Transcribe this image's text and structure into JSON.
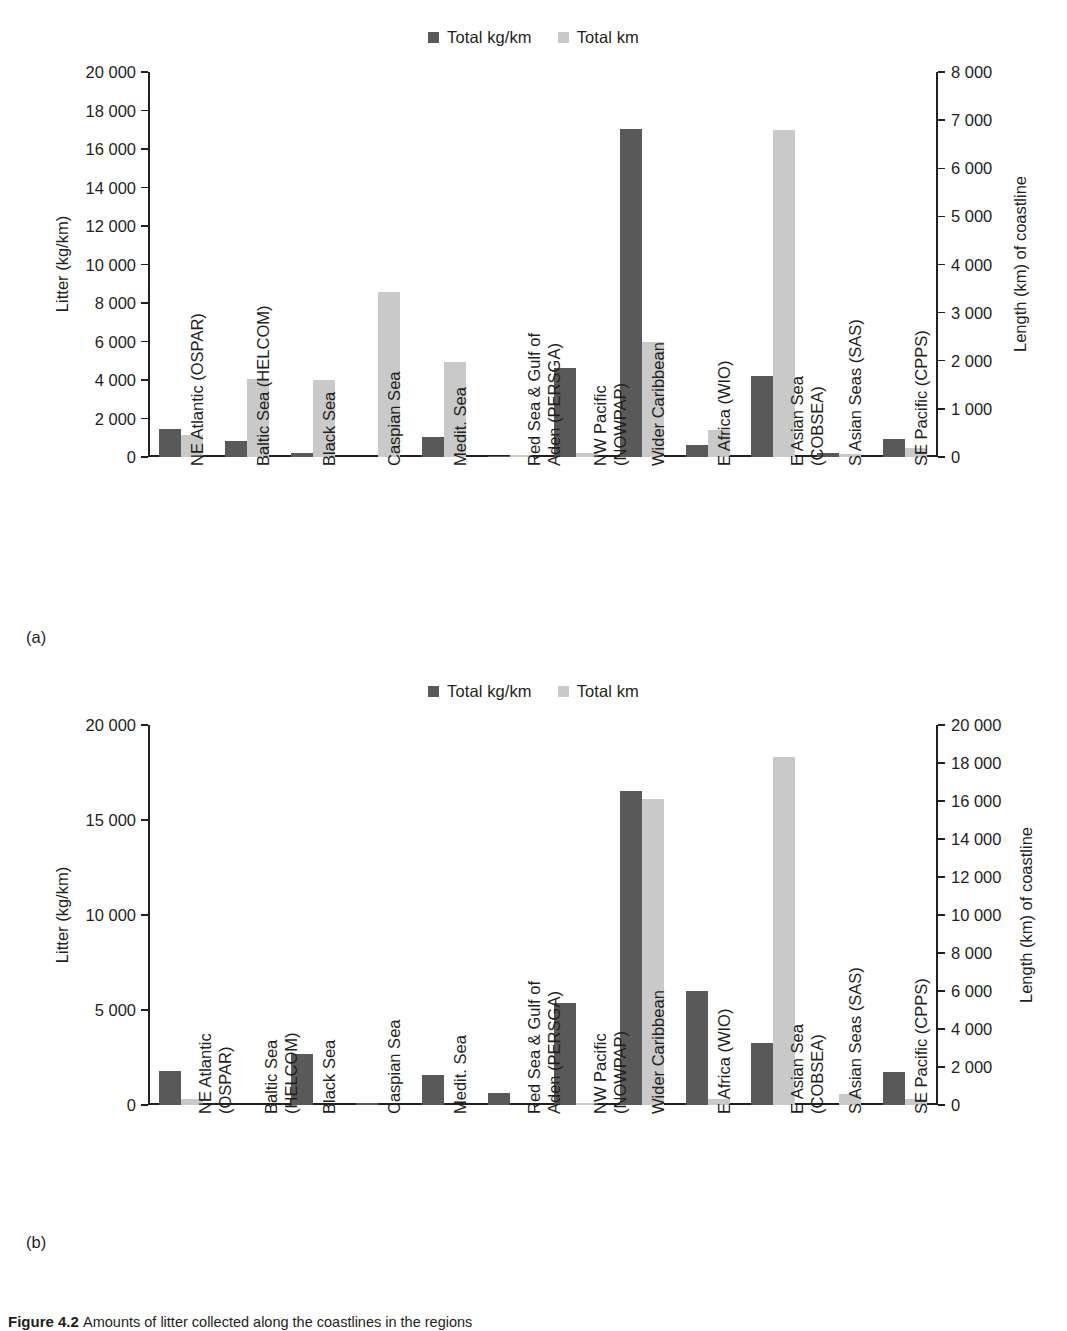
{
  "figure": {
    "caption_label": "Figure 4.2",
    "caption_text": "Amounts of litter collected along the coastlines in the regions"
  },
  "legend": {
    "series": [
      {
        "label": "Total kg/km",
        "color": "#595959",
        "swatch": "square-swatch"
      },
      {
        "label": "Total km",
        "color": "#c9c9c9",
        "swatch": "square-swatch"
      }
    ]
  },
  "panels": [
    {
      "tag": "(a)"
    },
    {
      "tag": "(b)"
    }
  ],
  "categories": [
    {
      "line1": "NE Atlantic (OSPAR)",
      "line2": "",
      "b_line1": "NE Atlantic",
      "b_line2": "(OSPAR)"
    },
    {
      "line1": "Baltic Sea (HELCOM)",
      "line2": "",
      "b_line1": "Baltic Sea",
      "b_line2": "(HELCOM)"
    },
    {
      "line1": "Black Sea",
      "line2": "",
      "b_line1": "Black Sea",
      "b_line2": ""
    },
    {
      "line1": "Caspian Sea",
      "line2": "",
      "b_line1": "Caspian Sea",
      "b_line2": ""
    },
    {
      "line1": "Medit. Sea",
      "line2": "",
      "b_line1": "Medit. Sea",
      "b_line2": ""
    },
    {
      "line1": "Red Sea & Gulf of",
      "line2": "Aden (PERSGA)",
      "b_line1": "Red Sea & Gulf of",
      "b_line2": "Aden (PERSGA)"
    },
    {
      "line1": "NW Pacific",
      "line2": "(NOWPAP)",
      "b_line1": "NW Pacific",
      "b_line2": "(NOWPAP)"
    },
    {
      "line1": "Wider Caribbean",
      "line2": "",
      "b_line1": "Wider Caribbean",
      "b_line2": ""
    },
    {
      "line1": "E Africa (WIO)",
      "line2": "",
      "b_line1": "E Africa (WIO)",
      "b_line2": ""
    },
    {
      "line1": "E Asian Sea",
      "line2": "(COBSEA)",
      "b_line1": "E Asian Sea",
      "b_line2": "(COBSEA)"
    },
    {
      "line1": "S Asian Seas (SAS)",
      "line2": "",
      "b_line1": "S Asian Seas (SAS)",
      "b_line2": ""
    },
    {
      "line1": "SE Pacific (CPPS)",
      "line2": "",
      "b_line1": "SE Pacific (CPPS)",
      "b_line2": ""
    }
  ],
  "chart_data": [
    {
      "type": "bar",
      "panel": "(a)",
      "title": "",
      "xlabel": "",
      "ylabel": "Litter (kg/km)",
      "y2label": "Length (km) of coastline",
      "ylim": [
        0,
        20000
      ],
      "y2lim": [
        0,
        8000
      ],
      "yticks": [
        0,
        2000,
        4000,
        6000,
        8000,
        10000,
        12000,
        14000,
        16000,
        18000,
        20000
      ],
      "yticklabels": [
        "0",
        "2 000",
        "4 000",
        "6 000",
        "8 000",
        "10 000",
        "12 000",
        "14 000",
        "16 000",
        "18 000",
        "20 000"
      ],
      "y2ticks": [
        0,
        1000,
        2000,
        3000,
        4000,
        5000,
        6000,
        7000,
        8000
      ],
      "y2ticklabels": [
        "0",
        "1 000",
        "2 000",
        "3 000",
        "4 000",
        "5 000",
        "6 000",
        "7 000",
        "8 000"
      ],
      "grid": false,
      "legend_position": "top-center",
      "categories": [
        "NE Atlantic (OSPAR)",
        "Baltic Sea (HELCOM)",
        "Black Sea",
        "Caspian Sea",
        "Medit. Sea",
        "Red Sea & Gulf of Aden (PERSGA)",
        "NW Pacific (NOWPAP)",
        "Wider Caribbean",
        "E Africa (WIO)",
        "E Asian Sea (COBSEA)",
        "S Asian Seas (SAS)",
        "SE Pacific (CPPS)"
      ],
      "series": [
        {
          "name": "Total kg/km",
          "axis": "left",
          "color": "#595959",
          "values": [
            1450,
            850,
            230,
            0,
            1020,
            70,
            4600,
            17050,
            610,
            4200,
            190,
            930
          ]
        },
        {
          "name": "Total km",
          "axis": "right",
          "color": "#c9c9c9",
          "values": [
            450,
            1630,
            1600,
            3420,
            1970,
            40,
            80,
            2400,
            560,
            6800,
            70,
            180
          ]
        }
      ]
    },
    {
      "type": "bar",
      "panel": "(b)",
      "title": "",
      "xlabel": "",
      "ylabel": "Litter (kg/km)",
      "y2label": "Length (km) of coastline",
      "ylim": [
        0,
        20000
      ],
      "y2lim": [
        0,
        20000
      ],
      "yticks": [
        0,
        5000,
        10000,
        15000,
        20000
      ],
      "yticklabels": [
        "0",
        "5 000",
        "10 000",
        "15 000",
        "20 000"
      ],
      "y2ticks": [
        0,
        2000,
        4000,
        6000,
        8000,
        10000,
        12000,
        14000,
        16000,
        18000,
        20000
      ],
      "y2ticklabels": [
        "0",
        "2 000",
        "4 000",
        "6 000",
        "8 000",
        "10 000",
        "12 000",
        "14 000",
        "16 000",
        "18 000",
        "20 000"
      ],
      "grid": false,
      "legend_position": "top-center",
      "categories": [
        "NE Atlantic (OSPAR)",
        "Baltic Sea (HELCOM)",
        "Black Sea",
        "Caspian Sea",
        "Medit. Sea",
        "Red Sea & Gulf of Aden (PERSGA)",
        "NW Pacific (NOWPAP)",
        "Wider Caribbean",
        "E Africa (WIO)",
        "E Asian Sea (COBSEA)",
        "S Asian Seas (SAS)",
        "SE Pacific (CPPS)"
      ],
      "series": [
        {
          "name": "Total kg/km",
          "axis": "left",
          "color": "#595959",
          "values": [
            1800,
            0,
            2700,
            130,
            1600,
            620,
            5350,
            16550,
            6000,
            3250,
            0,
            1750
          ]
        },
        {
          "name": "Total km",
          "axis": "right",
          "color": "#c9c9c9",
          "values": [
            300,
            0,
            0,
            0,
            0,
            0,
            100,
            16100,
            300,
            18300,
            560,
            300
          ]
        }
      ]
    }
  ]
}
